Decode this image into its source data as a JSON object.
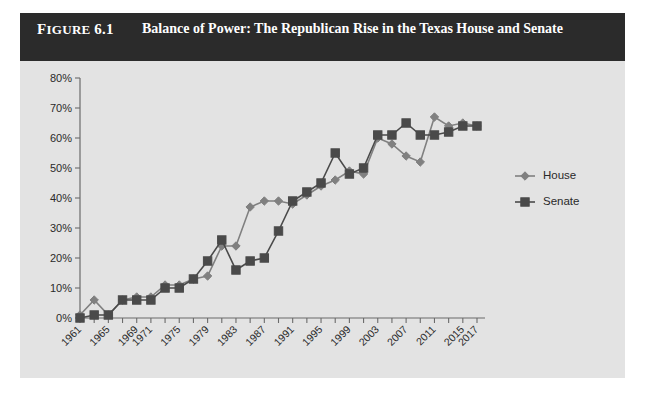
{
  "figure": {
    "label_small": "F",
    "label_rest": "IGURE",
    "label_number": "6.1",
    "title": "Balance of Power: The Republican Rise in the Texas House and Senate"
  },
  "colors": {
    "panel_background": "#e3e3e3",
    "title_bar": "#2b2b2b",
    "title_text": "#ffffff",
    "house": "#808080",
    "senate": "#4a4a4a",
    "axis": "#6b6b6b"
  },
  "chart_data": {
    "type": "line",
    "title": "Balance of Power: The Republican Rise in the Texas House and Senate",
    "xlabel": "",
    "ylabel": "",
    "ylim": [
      0,
      80
    ],
    "ytick_labels": [
      "0%",
      "10%",
      "20%",
      "30%",
      "40%",
      "50%",
      "60%",
      "70%",
      "80%"
    ],
    "ytick_values": [
      0,
      10,
      20,
      30,
      40,
      50,
      60,
      70,
      80
    ],
    "grid": false,
    "legend_position": "right",
    "x": [
      1961,
      1963,
      1965,
      1967,
      1969,
      1971,
      1973,
      1975,
      1977,
      1979,
      1981,
      1983,
      1985,
      1987,
      1989,
      1991,
      1993,
      1995,
      1997,
      1999,
      2001,
      2003,
      2005,
      2007,
      2009,
      2011,
      2013,
      2015,
      2017
    ],
    "xtick_labels": [
      "1961",
      "",
      "1965",
      "",
      "1969",
      "1971",
      "",
      "1975",
      "",
      "1979",
      "",
      "1983",
      "",
      "1987",
      "",
      "1991",
      "",
      "1995",
      "",
      "1999",
      "",
      "2003",
      "",
      "2007",
      "",
      "2011",
      "",
      "2015",
      "2017"
    ],
    "series": [
      {
        "name": "House",
        "marker": "diamond",
        "color": "#808080",
        "values": [
          1,
          6,
          1,
          6,
          7,
          7,
          11,
          11,
          13,
          14,
          24,
          24,
          37,
          39,
          39,
          38,
          41,
          44,
          46,
          49,
          48,
          60,
          58,
          54,
          52,
          67,
          64,
          65,
          64
        ]
      },
      {
        "name": "Senate",
        "marker": "square",
        "color": "#4a4a4a",
        "values": [
          0,
          1,
          1,
          6,
          6,
          6,
          10,
          10,
          13,
          19,
          26,
          16,
          19,
          20,
          29,
          39,
          42,
          45,
          55,
          48,
          50,
          61,
          61,
          65,
          61,
          61,
          62,
          64,
          64
        ]
      }
    ]
  },
  "legend": {
    "items": [
      {
        "label": "House"
      },
      {
        "label": "Senate"
      }
    ]
  }
}
